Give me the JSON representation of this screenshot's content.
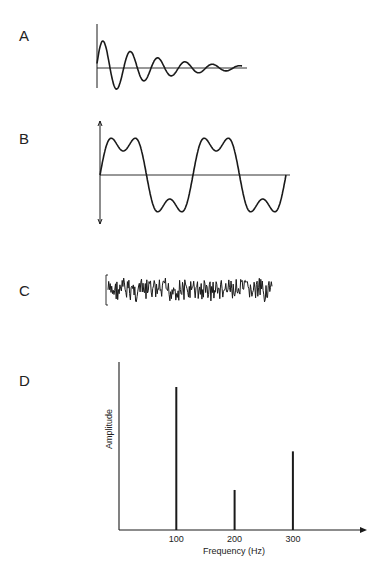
{
  "panels": {
    "A": {
      "label": "A",
      "description": "Damped sinusoidal oscillation"
    },
    "B": {
      "label": "B",
      "description": "Complex periodic waveform (sum of harmonics)"
    },
    "C": {
      "label": "C",
      "description": "Aperiodic noise waveform"
    },
    "D": {
      "label": "D",
      "description": "Amplitude spectrum of waveform B"
    }
  },
  "chart_data": {
    "type": "bar",
    "title": "",
    "xlabel": "Frequency (Hz)",
    "ylabel": "Amplitude",
    "categories": [
      "100",
      "200",
      "300"
    ],
    "x": [
      100,
      200,
      300
    ],
    "values": [
      1.0,
      0.28,
      0.55
    ],
    "xticks": [
      "100",
      "200",
      "300"
    ],
    "grid": false,
    "legend": null,
    "note": "Line spectrum; relative amplitudes estimated from line heights (no y tick values shown)"
  },
  "colors": {
    "ink": "#1a1a1a",
    "background": "#ffffff"
  }
}
